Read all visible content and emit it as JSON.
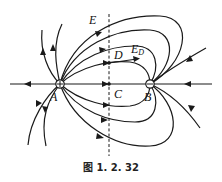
{
  "figure": {
    "caption": "图 1. 2. 32",
    "type": "electric field lines of two unequal point charges"
  },
  "charges": [
    {
      "label": "A",
      "sign": "+",
      "role": "positive charge (source of field lines)"
    },
    {
      "label": "B",
      "sign": "−",
      "role": "negative charge (sink of field lines)"
    }
  ],
  "labels": {
    "E": "E",
    "D": "D",
    "ED_main": "E",
    "ED_sub": "D",
    "C": "C",
    "A": "A",
    "B": "B"
  },
  "annotations": [
    {
      "name": "perpendicular-bisector",
      "style": "dashed vertical line between A and B"
    },
    {
      "name": "point-D",
      "description": "point on a field line crossing the dashed line, with field vector E_D"
    },
    {
      "name": "point-C",
      "description": "point on line AB where it crosses the dashed line"
    }
  ]
}
